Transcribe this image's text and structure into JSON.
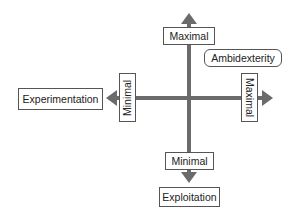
{
  "diagram": {
    "axis_color": "#6b6b6b",
    "vertical_axis": {
      "top_label": "Maximal",
      "bottom_label": "Minimal",
      "end_label": "Exploitation"
    },
    "horizontal_axis": {
      "left_label": "Minimal",
      "right_label": "Maximal",
      "end_label": "Experimentation"
    },
    "quadrant_label": "Ambidexterity"
  }
}
